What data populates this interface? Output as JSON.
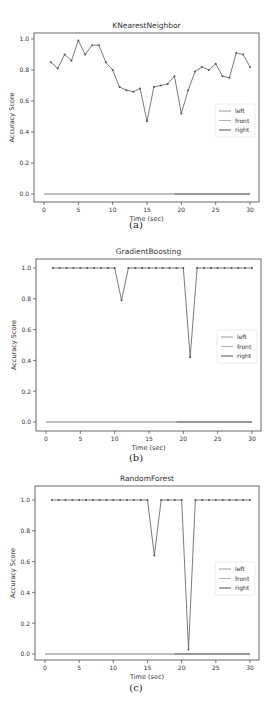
{
  "chart_data": [
    {
      "type": "line",
      "title": "KNearestNeighbor",
      "caption": "(a)",
      "xlabel": "Time (sec)",
      "ylabel": "Accuracy Score",
      "xlim": [
        0,
        30
      ],
      "ylim": [
        0.0,
        1.0
      ],
      "xticks": [
        0,
        5,
        10,
        15,
        20,
        25,
        30
      ],
      "yticks": [
        "0.0",
        "0.2",
        "0.4",
        "0.6",
        "0.8",
        "1.0"
      ],
      "grid": false,
      "legend": {
        "position": "center right",
        "entries": [
          "left",
          "front",
          "right"
        ]
      },
      "series": [
        {
          "name": "accuracy",
          "color": "#6b6b6b",
          "marker": "dot",
          "x": [
            1,
            2,
            3,
            4,
            5,
            6,
            7,
            8,
            9,
            10,
            11,
            12,
            13,
            14,
            15,
            16,
            17,
            18,
            19,
            20,
            21,
            22,
            23,
            24,
            25,
            26,
            27,
            28,
            29,
            30
          ],
          "y": [
            0.85,
            0.81,
            0.9,
            0.86,
            0.99,
            0.9,
            0.96,
            0.96,
            0.85,
            0.8,
            0.69,
            0.67,
            0.66,
            0.68,
            0.47,
            0.69,
            0.7,
            0.71,
            0.76,
            0.52,
            0.67,
            0.79,
            0.82,
            0.8,
            0.84,
            0.76,
            0.75,
            0.91,
            0.9,
            0.82
          ]
        },
        {
          "name": "left",
          "color": "#9a9a9a",
          "x": [
            0,
            19
          ],
          "y": [
            0.0,
            0.0
          ]
        },
        {
          "name": "front",
          "color": "#b0b0b0",
          "x": [
            0,
            30
          ],
          "y": [
            0.0,
            0.0
          ]
        },
        {
          "name": "right",
          "color": "#555555",
          "x": [
            19,
            30
          ],
          "y": [
            0.0,
            0.0
          ]
        }
      ]
    },
    {
      "type": "line",
      "title": "GradientBoosting",
      "caption": "(b)",
      "xlabel": "Time (sec)",
      "ylabel": "Accuracy Score",
      "xlim": [
        0,
        30
      ],
      "ylim": [
        0.0,
        1.0
      ],
      "xticks": [
        0,
        5,
        10,
        15,
        20,
        25,
        30
      ],
      "yticks": [
        "0.0",
        "0.2",
        "0.4",
        "0.6",
        "0.8",
        "1.0"
      ],
      "grid": false,
      "legend": {
        "position": "center right",
        "entries": [
          "left",
          "front",
          "right"
        ]
      },
      "series": [
        {
          "name": "accuracy",
          "color": "#6b6b6b",
          "marker": "dot",
          "x": [
            1,
            2,
            3,
            4,
            5,
            6,
            7,
            8,
            9,
            10,
            11,
            12,
            13,
            14,
            15,
            16,
            17,
            18,
            19,
            20,
            21,
            22,
            23,
            24,
            25,
            26,
            27,
            28,
            29,
            30
          ],
          "y": [
            1.0,
            1.0,
            1.0,
            1.0,
            1.0,
            1.0,
            1.0,
            1.0,
            1.0,
            1.0,
            0.79,
            1.0,
            1.0,
            1.0,
            1.0,
            1.0,
            1.0,
            1.0,
            1.0,
            1.0,
            0.42,
            1.0,
            1.0,
            1.0,
            1.0,
            1.0,
            1.0,
            1.0,
            1.0,
            1.0
          ]
        },
        {
          "name": "left",
          "color": "#9a9a9a",
          "x": [
            0,
            19
          ],
          "y": [
            0.0,
            0.0
          ]
        },
        {
          "name": "front",
          "color": "#b0b0b0",
          "x": [
            0,
            30
          ],
          "y": [
            0.0,
            0.0
          ]
        },
        {
          "name": "right",
          "color": "#555555",
          "x": [
            19,
            30
          ],
          "y": [
            0.0,
            0.0
          ]
        }
      ]
    },
    {
      "type": "line",
      "title": "RandomForest",
      "caption": "(c)",
      "xlabel": "Time (sec)",
      "ylabel": "Accuracy Score",
      "xlim": [
        0,
        30
      ],
      "ylim": [
        0.0,
        1.0
      ],
      "xticks": [
        0,
        5,
        10,
        15,
        20,
        25,
        30
      ],
      "yticks": [
        "0.0",
        "0.2",
        "0.4",
        "0.6",
        "0.8",
        "1.0"
      ],
      "grid": false,
      "legend": {
        "position": "center right",
        "entries": [
          "left",
          "front",
          "right"
        ]
      },
      "series": [
        {
          "name": "accuracy",
          "color": "#6b6b6b",
          "marker": "dot",
          "x": [
            1,
            2,
            3,
            4,
            5,
            6,
            7,
            8,
            9,
            10,
            11,
            12,
            13,
            14,
            15,
            16,
            17,
            18,
            19,
            20,
            21,
            22,
            23,
            24,
            25,
            26,
            27,
            28,
            29,
            30
          ],
          "y": [
            1.0,
            1.0,
            1.0,
            1.0,
            1.0,
            1.0,
            1.0,
            1.0,
            1.0,
            1.0,
            1.0,
            1.0,
            1.0,
            1.0,
            1.0,
            0.64,
            1.0,
            1.0,
            1.0,
            1.0,
            0.03,
            1.0,
            1.0,
            1.0,
            1.0,
            1.0,
            1.0,
            1.0,
            1.0,
            1.0
          ]
        },
        {
          "name": "left",
          "color": "#9a9a9a",
          "x": [
            0,
            19
          ],
          "y": [
            0.0,
            0.0
          ]
        },
        {
          "name": "front",
          "color": "#b0b0b0",
          "x": [
            0,
            30
          ],
          "y": [
            0.0,
            0.0
          ]
        },
        {
          "name": "right",
          "color": "#555555",
          "x": [
            19,
            30
          ],
          "y": [
            0.0,
            0.0
          ]
        }
      ]
    }
  ],
  "layout": {
    "panels": [
      {
        "top": 0,
        "height": 236,
        "frame": {
          "x0": 34,
          "x1": 259,
          "y0": 33,
          "y1": 202
        },
        "data_x0": 44,
        "data_x1": 250,
        "data_y0": 194,
        "data_y1": 39,
        "caption_y": 222,
        "legend_y": 104
      },
      {
        "top": 236,
        "height": 238,
        "frame": {
          "x0": 36,
          "x1": 261,
          "y0": 23,
          "y1": 195
        },
        "data_x0": 46,
        "data_x1": 252,
        "data_y0": 186,
        "data_y1": 32,
        "caption_y": 219,
        "legend_y": 94
      },
      {
        "top": 474,
        "height": 240,
        "frame": {
          "x0": 35,
          "x1": 259,
          "y0": 12,
          "y1": 186
        },
        "data_x0": 45,
        "data_x1": 250,
        "data_y0": 180,
        "data_y1": 26,
        "caption_y": 211,
        "legend_y": 88
      }
    ]
  }
}
